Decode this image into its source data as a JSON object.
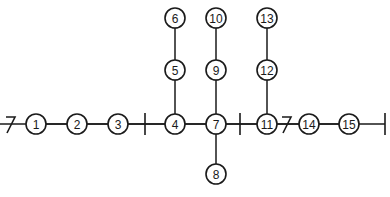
{
  "diagram": {
    "type": "tree-network",
    "background": "#ffffff",
    "stroke": "#1a1a1a",
    "nodes": [
      {
        "id": "1",
        "label": "1",
        "x": 36,
        "y": 124
      },
      {
        "id": "2",
        "label": "2",
        "x": 77,
        "y": 124
      },
      {
        "id": "3",
        "label": "3",
        "x": 118,
        "y": 124
      },
      {
        "id": "4",
        "label": "4",
        "x": 175,
        "y": 124
      },
      {
        "id": "5",
        "label": "5",
        "x": 175,
        "y": 70
      },
      {
        "id": "6",
        "label": "6",
        "x": 175,
        "y": 18
      },
      {
        "id": "7",
        "label": "7",
        "x": 216,
        "y": 124
      },
      {
        "id": "8",
        "label": "8",
        "x": 216,
        "y": 174
      },
      {
        "id": "9",
        "label": "9",
        "x": 216,
        "y": 70
      },
      {
        "id": "10",
        "label": "10",
        "x": 216,
        "y": 18
      },
      {
        "id": "11",
        "label": "11",
        "x": 267,
        "y": 124
      },
      {
        "id": "12",
        "label": "12",
        "x": 267,
        "y": 70
      },
      {
        "id": "13",
        "label": "13",
        "x": 267,
        "y": 18
      },
      {
        "id": "14",
        "label": "14",
        "x": 309,
        "y": 124
      },
      {
        "id": "15",
        "label": "15",
        "x": 349,
        "y": 124
      }
    ],
    "edges": [
      [
        "1",
        "2"
      ],
      [
        "2",
        "3"
      ],
      [
        "3",
        "4"
      ],
      [
        "4",
        "7"
      ],
      [
        "7",
        "11"
      ],
      [
        "11",
        "14"
      ],
      [
        "14",
        "15"
      ],
      [
        "4",
        "5"
      ],
      [
        "5",
        "6"
      ],
      [
        "7",
        "9"
      ],
      [
        "9",
        "10"
      ],
      [
        "7",
        "8"
      ],
      [
        "11",
        "12"
      ],
      [
        "12",
        "13"
      ]
    ],
    "markers": [
      {
        "type": "bar",
        "x": 145,
        "y": 124
      },
      {
        "type": "bar",
        "x": 240,
        "y": 124
      },
      {
        "type": "bar",
        "x": 385,
        "y": 124
      },
      {
        "type": "seven-slash",
        "x": 10,
        "y": 124
      },
      {
        "type": "seven-slash",
        "x": 286,
        "y": 124
      }
    ],
    "line_extent": {
      "x_start": 0,
      "x_end": 385,
      "y": 124
    }
  }
}
